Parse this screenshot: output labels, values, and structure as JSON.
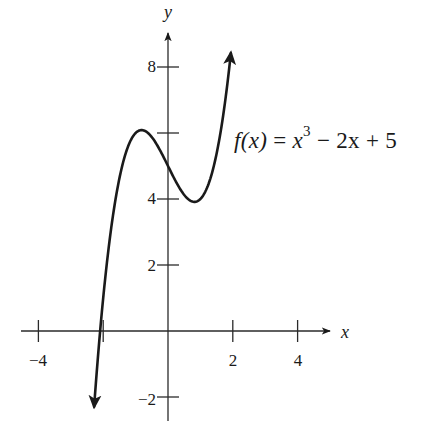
{
  "chart_data": {
    "type": "line",
    "title": "",
    "function_label": {
      "lhs": "f(x)",
      "eq": "=",
      "rhs_base": "x",
      "rhs_exp": "3",
      "rhs_rest": "− 2x + 5",
      "full": "f(x) = x^3 − 2x + 5"
    },
    "function": {
      "expression": "x^3 - 2x + 5",
      "coefficients": [
        1,
        0,
        -2,
        5
      ],
      "x_domain": [
        -2.28,
        1.94
      ]
    },
    "series": [
      {
        "name": "f(x) = x^3 - 2x + 5",
        "x": [
          -2.28,
          -2.0,
          -1.5,
          -1.0,
          -0.816,
          -0.5,
          0.0,
          0.5,
          0.816,
          1.0,
          1.5,
          1.94
        ],
        "y": [
          -2.29,
          1.0,
          4.63,
          6.0,
          6.09,
          5.88,
          5.0,
          4.13,
          3.91,
          4.0,
          5.38,
          8.42
        ]
      }
    ],
    "key_points": {
      "local_max": {
        "x": -0.816,
        "y": 6.09
      },
      "local_min": {
        "x": 0.816,
        "y": 3.91
      },
      "y_intercept": {
        "x": 0,
        "y": 5
      },
      "x_intercept_approx": {
        "x": -2.09,
        "y": 0
      }
    },
    "xlabel": "x",
    "ylabel": "y",
    "x_ticks": [
      -4,
      -2,
      2,
      4
    ],
    "x_tick_labels": [
      "-4",
      "",
      "2",
      "4"
    ],
    "y_ticks": [
      -2,
      2,
      4,
      6,
      8
    ],
    "y_tick_labels": [
      "-2",
      "2",
      "4",
      "",
      "8"
    ],
    "xlim": [
      -4.5,
      4.9
    ],
    "ylim": [
      -2.7,
      9.5
    ],
    "grid": false,
    "legend": "none",
    "arrows": {
      "curve_both_ends": true,
      "x_axis_positive": true,
      "y_axis_positive": true
    }
  },
  "layout_px": {
    "origin": [
      168,
      331
    ],
    "x_scale": 32.4,
    "y_scale": 33.0,
    "x_axis_range_px": [
      21,
      330
    ],
    "y_axis_range_px": [
      33,
      421
    ]
  },
  "labels": {
    "x_axis": "x",
    "y_axis": "y",
    "tick_neg4": "−4",
    "tick_2": "2",
    "tick_4": "4",
    "tick_neg2_y": "−2",
    "tick_2_y": "2",
    "tick_4_y": "4",
    "tick_8_y": "8"
  }
}
